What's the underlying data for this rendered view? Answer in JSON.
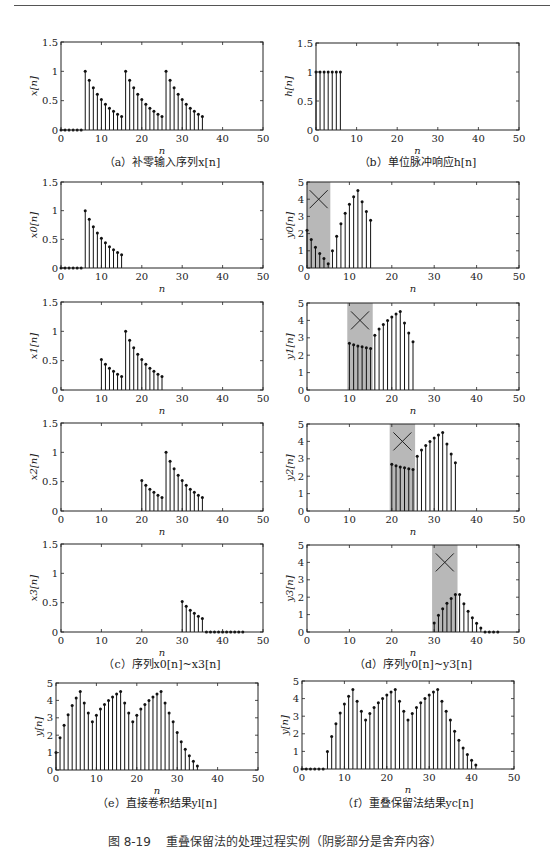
{
  "header": {
    "text": ""
  },
  "figure": {
    "caption": "图 8-19    重叠保留法的处理过程实例（阴影部分是舍弃内容）"
  },
  "captions": {
    "a": "（a）补零输入序列x[n]",
    "b": "（b）单位脉冲响应h[n]",
    "c": "（c）序列x0[n]~x3[n]",
    "d": "（d）序列y0[n]~y3[n]",
    "e": "（e）直接卷积结果yl[n]",
    "f": "（f）重叠保留法结果yc[n]"
  },
  "chart_data": [
    {
      "id": "a",
      "type": "stem",
      "title": "（a）补零输入序列x[n]",
      "xlabel": "n",
      "ylabel": "x[n]",
      "xlim": [
        0,
        50
      ],
      "ylim": [
        0,
        1.5
      ],
      "xticks": [
        0,
        10,
        20,
        30,
        40,
        50
      ],
      "yticks": [
        0,
        0.5,
        1,
        1.5
      ],
      "ytick_labels": [
        "0",
        "0.5",
        "1",
        "1.5"
      ],
      "x": [
        0,
        1,
        2,
        3,
        4,
        5,
        6,
        7,
        8,
        9,
        10,
        11,
        12,
        13,
        14,
        15,
        16,
        17,
        18,
        19,
        20,
        21,
        22,
        23,
        24,
        25,
        26,
        27,
        28,
        29,
        30,
        31,
        32,
        33,
        34,
        35
      ],
      "values": [
        0,
        0,
        0,
        0,
        0,
        0,
        1,
        0.85,
        0.72,
        0.61,
        0.52,
        0.44,
        0.37,
        0.32,
        0.27,
        0.23,
        1,
        0.85,
        0.72,
        0.61,
        0.52,
        0.44,
        0.37,
        0.32,
        0.27,
        0.23,
        1,
        0.85,
        0.72,
        0.61,
        0.52,
        0.44,
        0.37,
        0.32,
        0.27,
        0.23
      ],
      "shade": null,
      "show_xlabel": true
    },
    {
      "id": "b",
      "type": "stem",
      "title": "（b）单位脉冲响应h[n]",
      "xlabel": "n",
      "ylabel": "h[n]",
      "xlim": [
        0,
        50
      ],
      "ylim": [
        0,
        1.5
      ],
      "xticks": [
        0,
        10,
        20,
        30,
        40,
        50
      ],
      "yticks": [
        0,
        0.5,
        1,
        1.5
      ],
      "ytick_labels": [
        "0",
        "0.5",
        "1",
        "1.5"
      ],
      "x": [
        0,
        1,
        2,
        3,
        4,
        5,
        6
      ],
      "values": [
        1,
        1,
        1,
        1,
        1,
        1,
        1
      ],
      "shade": null,
      "show_xlabel": true
    },
    {
      "id": "x0",
      "type": "stem",
      "xlabel": "n",
      "ylabel": "x0[n]",
      "xlim": [
        0,
        50
      ],
      "ylim": [
        0,
        1.5
      ],
      "xticks": [
        0,
        10,
        20,
        30,
        40,
        50
      ],
      "yticks": [
        0,
        0.5,
        1,
        1.5
      ],
      "ytick_labels": [
        "0",
        "0.5",
        "1",
        "1.5"
      ],
      "x": [
        0,
        1,
        2,
        3,
        4,
        5,
        6,
        7,
        8,
        9,
        10,
        11,
        12,
        13,
        14,
        15
      ],
      "values": [
        0,
        0,
        0,
        0,
        0,
        0,
        1,
        0.85,
        0.72,
        0.61,
        0.52,
        0.44,
        0.37,
        0.32,
        0.27,
        0.23
      ],
      "shade": null,
      "show_xlabel": true
    },
    {
      "id": "y0",
      "type": "stem",
      "xlabel": "n",
      "ylabel": "y0[n]",
      "xlim": [
        0,
        50
      ],
      "ylim": [
        0,
        5
      ],
      "xticks": [
        0,
        10,
        20,
        30,
        40,
        50
      ],
      "yticks": [
        0,
        1,
        2,
        3,
        4,
        5
      ],
      "ytick_labels": [
        "0",
        "1",
        "2",
        "3",
        "4",
        "5"
      ],
      "x": [
        0,
        1,
        2,
        3,
        4,
        5,
        6,
        7,
        8,
        9,
        10,
        11,
        12,
        13,
        14,
        15
      ],
      "values": [
        2.2,
        1.65,
        1.2,
        0.85,
        0.55,
        0.25,
        1.0,
        1.85,
        2.57,
        3.18,
        3.7,
        4.14,
        4.51,
        3.85,
        3.28,
        2.78
      ],
      "shade": [
        0,
        5.5
      ],
      "show_xlabel": true
    },
    {
      "id": "x1",
      "type": "stem",
      "xlabel": "n",
      "ylabel": "x1[n]",
      "xlim": [
        0,
        50
      ],
      "ylim": [
        0,
        1.5
      ],
      "xticks": [
        0,
        10,
        20,
        30,
        40,
        50
      ],
      "yticks": [
        0,
        0.5,
        1,
        1.5
      ],
      "ytick_labels": [
        "0",
        "0.5",
        "1",
        "1.5"
      ],
      "x": [
        10,
        11,
        12,
        13,
        14,
        15,
        16,
        17,
        18,
        19,
        20,
        21,
        22,
        23,
        24,
        25
      ],
      "values": [
        0.52,
        0.44,
        0.37,
        0.32,
        0.27,
        0.23,
        1,
        0.85,
        0.72,
        0.61,
        0.52,
        0.44,
        0.37,
        0.32,
        0.27,
        0.23
      ],
      "shade": null,
      "show_xlabel": true
    },
    {
      "id": "y1",
      "type": "stem",
      "xlabel": "n",
      "ylabel": "y1[n]",
      "xlim": [
        0,
        50
      ],
      "ylim": [
        0,
        5
      ],
      "xticks": [
        0,
        10,
        20,
        30,
        40,
        50
      ],
      "yticks": [
        0,
        1,
        2,
        3,
        4,
        5
      ],
      "ytick_labels": [
        "0",
        "1",
        "2",
        "3",
        "4",
        "5"
      ],
      "x": [
        10,
        11,
        12,
        13,
        14,
        15,
        16,
        17,
        18,
        19,
        20,
        21,
        22,
        23,
        24,
        25
      ],
      "values": [
        2.68,
        2.6,
        2.53,
        2.48,
        2.43,
        2.38,
        3.15,
        3.5,
        3.77,
        4.0,
        4.2,
        4.37,
        4.51,
        3.85,
        3.28,
        2.78
      ],
      "shade": [
        9.5,
        15.5
      ],
      "show_xlabel": true
    },
    {
      "id": "x2",
      "type": "stem",
      "xlabel": "n",
      "ylabel": "x2[n]",
      "xlim": [
        0,
        50
      ],
      "ylim": [
        0,
        1.5
      ],
      "xticks": [
        0,
        10,
        20,
        30,
        40,
        50
      ],
      "yticks": [
        0,
        0.5,
        1,
        1.5
      ],
      "ytick_labels": [
        "0",
        "0.5",
        "1",
        "1.5"
      ],
      "x": [
        20,
        21,
        22,
        23,
        24,
        25,
        26,
        27,
        28,
        29,
        30,
        31,
        32,
        33,
        34,
        35
      ],
      "values": [
        0.52,
        0.44,
        0.37,
        0.32,
        0.27,
        0.23,
        1,
        0.85,
        0.72,
        0.61,
        0.52,
        0.44,
        0.37,
        0.32,
        0.27,
        0.23
      ],
      "shade": null,
      "show_xlabel": true
    },
    {
      "id": "y2",
      "type": "stem",
      "xlabel": "n",
      "ylabel": "y2[n]",
      "xlim": [
        0,
        50
      ],
      "ylim": [
        0,
        5
      ],
      "xticks": [
        0,
        10,
        20,
        30,
        40,
        50
      ],
      "yticks": [
        0,
        1,
        2,
        3,
        4,
        5
      ],
      "ytick_labels": [
        "0",
        "1",
        "2",
        "3",
        "4",
        "5"
      ],
      "x": [
        20,
        21,
        22,
        23,
        24,
        25,
        26,
        27,
        28,
        29,
        30,
        31,
        32,
        33,
        34,
        35
      ],
      "values": [
        2.68,
        2.6,
        2.53,
        2.48,
        2.43,
        2.38,
        3.15,
        3.5,
        3.77,
        4.0,
        4.2,
        4.37,
        4.51,
        3.85,
        3.28,
        2.78
      ],
      "shade": [
        19.5,
        25.5
      ],
      "show_xlabel": true
    },
    {
      "id": "x3",
      "type": "stem",
      "xlabel": "n",
      "ylabel": "x3[n]",
      "xlim": [
        0,
        50
      ],
      "ylim": [
        0,
        1.5
      ],
      "xticks": [
        0,
        10,
        20,
        30,
        40,
        50
      ],
      "yticks": [
        0,
        0.5,
        1,
        1.5
      ],
      "ytick_labels": [
        "0",
        "0.5",
        "1",
        "1.5"
      ],
      "x": [
        30,
        31,
        32,
        33,
        34,
        35,
        36,
        37,
        38,
        39,
        40,
        41,
        42,
        43,
        44,
        45
      ],
      "values": [
        0.52,
        0.44,
        0.37,
        0.32,
        0.27,
        0.23,
        0,
        0,
        0,
        0,
        0,
        0,
        0,
        0,
        0,
        0
      ],
      "shade": null,
      "show_xlabel": true
    },
    {
      "id": "y3",
      "type": "stem",
      "xlabel": "n",
      "ylabel": "y3[n]",
      "xlim": [
        0,
        50
      ],
      "ylim": [
        0,
        5
      ],
      "xticks": [
        0,
        10,
        20,
        30,
        40,
        50
      ],
      "yticks": [
        0,
        1,
        2,
        3,
        4,
        5
      ],
      "ytick_labels": [
        "0",
        "1",
        "2",
        "3",
        "4",
        "5"
      ],
      "x": [
        30,
        31,
        32,
        33,
        34,
        35,
        36,
        37,
        38,
        39,
        40,
        41,
        42,
        43,
        44,
        45
      ],
      "values": [
        0.52,
        0.96,
        1.33,
        1.65,
        1.92,
        2.15,
        2.15,
        1.63,
        1.19,
        0.82,
        0.5,
        0.23,
        0,
        0,
        0,
        0
      ],
      "shade": [
        29.5,
        35.5
      ],
      "show_xlabel": true
    },
    {
      "id": "e",
      "type": "stem",
      "title": "（e）直接卷积结果yl[n]",
      "xlabel": "n",
      "ylabel": "y[n]",
      "xlim": [
        0,
        50
      ],
      "ylim": [
        0,
        5
      ],
      "xticks": [
        0,
        10,
        20,
        30,
        40,
        50
      ],
      "yticks": [
        0,
        1,
        2,
        3,
        4,
        5
      ],
      "ytick_labels": [
        "0",
        "1",
        "2",
        "3",
        "4",
        "5"
      ],
      "x": [
        0,
        1,
        2,
        3,
        4,
        5,
        6,
        7,
        8,
        9,
        10,
        11,
        12,
        13,
        14,
        15,
        16,
        17,
        18,
        19,
        20,
        21,
        22,
        23,
        24,
        25,
        26,
        27,
        28,
        29,
        30,
        31,
        32,
        33,
        34,
        35
      ],
      "values": [
        1.0,
        1.85,
        2.57,
        3.18,
        3.7,
        4.14,
        4.51,
        3.85,
        3.28,
        2.78,
        3.15,
        3.5,
        3.77,
        4.0,
        4.2,
        4.37,
        4.51,
        3.85,
        3.28,
        2.78,
        3.15,
        3.5,
        3.77,
        4.0,
        4.2,
        4.37,
        4.51,
        3.85,
        3.28,
        2.78,
        2.15,
        1.63,
        1.19,
        0.82,
        0.5,
        0.23
      ],
      "shade": null,
      "show_xlabel": true
    },
    {
      "id": "f",
      "type": "stem",
      "title": "（f）重叠保留法结果yc[n]",
      "xlabel": "n",
      "ylabel": "y[n]",
      "xlim": [
        0,
        50
      ],
      "ylim": [
        0,
        5
      ],
      "xticks": [
        0,
        10,
        20,
        30,
        40,
        50
      ],
      "yticks": [
        0,
        1,
        2,
        3,
        4,
        5
      ],
      "ytick_labels": [
        "0",
        "1",
        "2",
        "3",
        "4",
        "5"
      ],
      "x": [
        0,
        1,
        2,
        3,
        4,
        5,
        6,
        7,
        8,
        9,
        10,
        11,
        12,
        13,
        14,
        15,
        16,
        17,
        18,
        19,
        20,
        21,
        22,
        23,
        24,
        25,
        26,
        27,
        28,
        29,
        30,
        31,
        32,
        33,
        34,
        35,
        36,
        37,
        38,
        39,
        40,
        41
      ],
      "values": [
        0,
        0,
        0,
        0,
        0,
        0,
        1.0,
        1.85,
        2.57,
        3.18,
        3.7,
        4.14,
        4.51,
        3.85,
        3.28,
        2.78,
        3.15,
        3.5,
        3.77,
        4.0,
        4.2,
        4.37,
        4.51,
        3.85,
        3.28,
        2.78,
        3.15,
        3.5,
        3.77,
        4.0,
        4.2,
        4.37,
        4.51,
        3.85,
        3.28,
        2.78,
        2.15,
        1.63,
        1.19,
        0.82,
        0.5,
        0.23
      ],
      "shade": null,
      "show_xlabel": true
    }
  ],
  "layout": {
    "panels": [
      {
        "chart": 0,
        "left": 61,
        "top": 42,
        "width": 202,
        "height": 88
      },
      {
        "chart": 1,
        "left": 316,
        "top": 43,
        "width": 203,
        "height": 87
      },
      {
        "chart": 2,
        "left": 61,
        "top": 182,
        "width": 202,
        "height": 86
      },
      {
        "chart": 3,
        "left": 307,
        "top": 182,
        "width": 212,
        "height": 86
      },
      {
        "chart": 4,
        "left": 61,
        "top": 302,
        "width": 202,
        "height": 88
      },
      {
        "chart": 5,
        "left": 307,
        "top": 303,
        "width": 212,
        "height": 87
      },
      {
        "chart": 6,
        "left": 61,
        "top": 423,
        "width": 202,
        "height": 88
      },
      {
        "chart": 7,
        "left": 307,
        "top": 424,
        "width": 212,
        "height": 87
      },
      {
        "chart": 8,
        "left": 61,
        "top": 544,
        "width": 202,
        "height": 88
      },
      {
        "chart": 9,
        "left": 307,
        "top": 545,
        "width": 212,
        "height": 87
      },
      {
        "chart": 10,
        "left": 56,
        "top": 683,
        "width": 202,
        "height": 87
      },
      {
        "chart": 11,
        "left": 302,
        "top": 681,
        "width": 212,
        "height": 88
      }
    ]
  }
}
